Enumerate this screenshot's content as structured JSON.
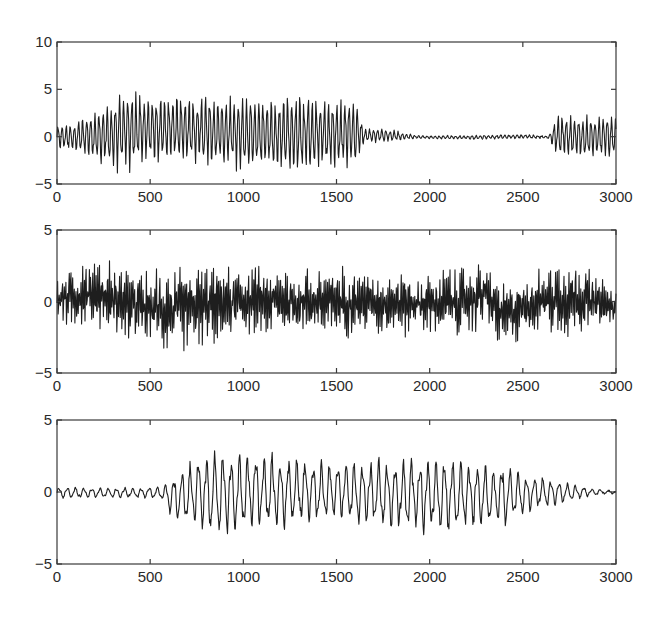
{
  "figure": {
    "panel_count": 3,
    "line_color": "#1e1e1e",
    "frame_color": "#3a3a3a",
    "background": "#ffffff"
  },
  "chart_data": [
    {
      "type": "line",
      "title": "",
      "xlabel": "",
      "ylabel": "",
      "xlim": [
        0,
        3000
      ],
      "ylim": [
        -5,
        10
      ],
      "xticks": [
        0,
        500,
        1000,
        1500,
        2000,
        2500,
        3000
      ],
      "yticks": [
        -5,
        0,
        5,
        10
      ],
      "xtick_labels": [
        "0",
        "500",
        "1000",
        "1500",
        "2000",
        "2500",
        "3000"
      ],
      "ytick_labels": [
        "−5",
        "0",
        "5",
        "10"
      ],
      "grid": false,
      "description": "Oscillatory signal: growing amplitude to ~±5 from 0–400, sustained dense oscillation (peaks ~4.5, troughs ~−4) to ~1600, decaying ringing 1600–1900, near-flat 1900–2650 with small spikes near 2220 and 2300, then regular oscillation ±2.5 from 2650 to 3000.",
      "envelope": {
        "x": [
          0,
          100,
          200,
          300,
          400,
          500,
          700,
          900,
          1100,
          1300,
          1450,
          1600,
          1650,
          1750,
          1850,
          1950,
          2200,
          2500,
          2640,
          2680,
          2800,
          3000
        ],
        "upper": [
          1.2,
          1.8,
          2.8,
          4.0,
          5.2,
          4.5,
          4.7,
          4.2,
          4.3,
          4.6,
          4.0,
          4.2,
          0.9,
          1.0,
          0.5,
          0.1,
          0.15,
          0.25,
          0.1,
          2.5,
          2.3,
          2.4
        ],
        "lower": [
          -1.2,
          -1.8,
          -2.8,
          -3.6,
          -3.8,
          -2.8,
          -3.0,
          -3.3,
          -3.6,
          -4.1,
          -3.4,
          -3.4,
          -0.6,
          -0.7,
          -0.4,
          -0.2,
          -0.3,
          -0.2,
          -0.2,
          -2.3,
          -2.5,
          -2.4
        ]
      },
      "period_samples": 22
    },
    {
      "type": "line",
      "title": "",
      "xlabel": "",
      "ylabel": "",
      "xlim": [
        0,
        3000
      ],
      "ylim": [
        -5,
        5
      ],
      "xticks": [
        0,
        500,
        1000,
        1500,
        2000,
        2500,
        3000
      ],
      "yticks": [
        -5,
        0,
        5
      ],
      "xtick_labels": [
        "0",
        "500",
        "1000",
        "1500",
        "2000",
        "2500",
        "3000"
      ],
      "ytick_labels": [
        "−5",
        "0",
        "5"
      ],
      "grid": false,
      "description": "Noisy broadband signal throughout, typical range about −3 to +3, occasional peaks to ~+3.6 (near x=200, 2300, 2800) and troughs to ~−4 (near x=480, 640, 2390).",
      "envelope": {
        "x": [
          0,
          200,
          480,
          640,
          1000,
          1500,
          2000,
          2150,
          2300,
          2390,
          2550,
          2800,
          3000
        ],
        "upper": [
          2.4,
          3.6,
          3.0,
          3.0,
          2.8,
          3.0,
          2.8,
          3.0,
          3.6,
          2.0,
          2.8,
          3.8,
          1.0
        ],
        "lower": [
          -2.0,
          -2.5,
          -4.0,
          -4.1,
          -2.8,
          -3.0,
          -3.0,
          -3.2,
          -2.6,
          -4.1,
          -2.8,
          -3.2,
          -2.0
        ]
      },
      "period_samples": 9
    },
    {
      "type": "line",
      "title": "",
      "xlabel": "",
      "ylabel": "",
      "xlim": [
        0,
        3000
      ],
      "ylim": [
        -5,
        5
      ],
      "xticks": [
        0,
        500,
        1000,
        1500,
        2000,
        2500,
        3000
      ],
      "yticks": [
        -5,
        0,
        5
      ],
      "xtick_labels": [
        "0",
        "500",
        "1000",
        "1500",
        "2000",
        "2500",
        "3000"
      ],
      "ytick_labels": [
        "−5",
        "0",
        "5"
      ],
      "grid": false,
      "description": "Small fluctuations (±0.5) from 0–580, then oscillation burst: amplitude ~+3/−3 around 800–1100, ~+2.5/−2.5 through 2400, decaying to near zero by ~2850, flat to 3000.",
      "envelope": {
        "x": [
          0,
          300,
          560,
          620,
          750,
          900,
          1050,
          1200,
          1500,
          1800,
          2000,
          2200,
          2400,
          2550,
          2700,
          2850,
          3000
        ],
        "upper": [
          0.4,
          0.3,
          0.4,
          1.2,
          2.6,
          3.0,
          3.0,
          2.6,
          2.2,
          2.4,
          2.6,
          2.4,
          2.0,
          1.2,
          0.8,
          0.3,
          0.1
        ],
        "lower": [
          -0.5,
          -0.4,
          -0.5,
          -2.0,
          -2.8,
          -3.2,
          -3.0,
          -2.6,
          -2.0,
          -2.8,
          -2.9,
          -2.8,
          -2.5,
          -1.4,
          -0.9,
          -0.3,
          -0.1
        ]
      },
      "period_samples": 44
    }
  ]
}
